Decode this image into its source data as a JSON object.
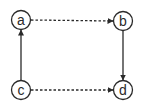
{
  "diagram": {
    "nodes": [
      {
        "id": "a",
        "label": "a",
        "x": 21,
        "y": 20
      },
      {
        "id": "b",
        "label": "b",
        "x": 123,
        "y": 21
      },
      {
        "id": "c",
        "label": "c",
        "x": 21,
        "y": 90
      },
      {
        "id": "d",
        "label": "d",
        "x": 123,
        "y": 90
      }
    ],
    "edges": [
      {
        "from": "a",
        "to": "b",
        "style": "dashed"
      },
      {
        "from": "b",
        "to": "d",
        "style": "solid"
      },
      {
        "from": "c",
        "to": "a",
        "style": "solid"
      },
      {
        "from": "c",
        "to": "d",
        "style": "dashed"
      }
    ],
    "colors": {
      "stroke": "#2a2a2a",
      "background": "#ffffff"
    }
  }
}
